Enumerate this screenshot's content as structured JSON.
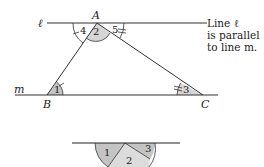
{
  "diagram": {
    "lines": {
      "l_label": "ℓ",
      "m_label": "m"
    },
    "vertices": {
      "A": "A",
      "B": "B",
      "C": "C"
    },
    "angles": {
      "a1": "1",
      "a2": "2",
      "a3": "3",
      "a4": "4",
      "a5": "5"
    },
    "note": {
      "line1": "Line ℓ",
      "line2": "is parallel",
      "line3": "to line m."
    },
    "semicircle": {
      "a1": "1",
      "a2": "2",
      "a3": "3"
    },
    "colors": {
      "line": "#333333",
      "shade_dark": "#bdbdbd",
      "shade_light": "#dcdcdc"
    }
  }
}
